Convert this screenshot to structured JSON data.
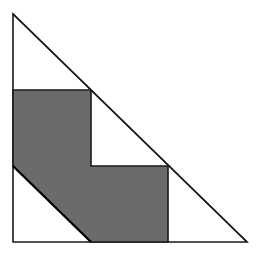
{
  "diagram": {
    "width": 264,
    "height": 258,
    "background": "#ffffff",
    "triangle": {
      "description": "right isosceles triangle",
      "points": "13,14 13,242 247,242",
      "fill": "#ffffff",
      "stroke": "#1a1a1a",
      "stroke_width": 1.6
    },
    "shaded_region": {
      "description": "shaded staircase-shaped hexagon inside triangle",
      "points": "13,90 91,90 91,166 168,166 168,242 91,242 13,166",
      "fill": "#6b6b6b",
      "stroke": "#1a1a1a",
      "stroke_width": 1.6
    },
    "shaded_diagonal_edge": {
      "x1": 13,
      "y1": 166,
      "x2": 91,
      "y2": 242,
      "stroke": "#000000",
      "stroke_width": 2.2
    }
  }
}
